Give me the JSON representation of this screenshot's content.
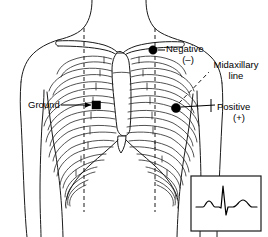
{
  "figure": {
    "background_color": "#ffffff",
    "line_color": "#1a1a1a"
  },
  "labels": {
    "negative": "Negative",
    "negative_sign": "(–)",
    "midaxillary_line_1": "Midaxillary",
    "midaxillary_line_2": "line",
    "positive": "Positive",
    "positive_sign": "(+)",
    "ground": "Ground"
  },
  "electrodes": [
    {
      "name": "negative",
      "label": "Negative",
      "sign": "(–)",
      "marker": "filled-circle",
      "x": 153,
      "y": 50
    },
    {
      "name": "ground",
      "label": "Ground",
      "sign": "",
      "marker": "filled-square",
      "x": 96,
      "y": 105
    },
    {
      "name": "positive",
      "label": "Positive",
      "sign": "(+)",
      "marker": "filled-circle",
      "x": 176,
      "y": 108
    }
  ],
  "reference_lines": [
    {
      "name": "midclavicular-left",
      "style": "dashed",
      "orientation": "vertical"
    },
    {
      "name": "midclavicular-right",
      "style": "dashed",
      "orientation": "vertical"
    },
    {
      "name": "midaxillary",
      "style": "dashed",
      "orientation": "diagonal"
    }
  ],
  "ecg_inset": {
    "name": "ecg-waveform",
    "waves": [
      "P",
      "QRS",
      "T"
    ],
    "box": {
      "x": 191,
      "y": 176,
      "width": 70,
      "height": 55
    }
  }
}
